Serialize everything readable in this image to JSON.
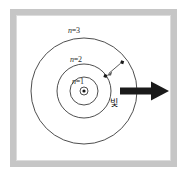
{
  "figure": {
    "frame": {
      "border_color": "#c6c6c6",
      "background_color": "#ffffff"
    },
    "colors": {
      "orbit_stroke": "#3a3a3a",
      "nucleus_stroke": "#3a3a3a",
      "nucleus_fill": "#1a1a1a",
      "electron_fill": "#1a1a1a",
      "transition_arrow": "#4a4a4a",
      "light_arrow": "#1a1a1a",
      "label_text": "#2b2b2b"
    },
    "orbits": [
      {
        "id": "n1",
        "label": "n=1",
        "label_prefix": "n",
        "label_suffix": "=1",
        "radius": 14,
        "center_x": 84,
        "center_y": 91
      },
      {
        "id": "n2",
        "label": "n=2",
        "label_prefix": "n",
        "label_suffix": "=2",
        "radius": 27,
        "center_x": 84,
        "center_y": 91
      },
      {
        "id": "n3",
        "label": "n=3",
        "label_prefix": "n",
        "label_suffix": "=3",
        "radius": 53,
        "center_x": 84,
        "center_y": 91
      }
    ],
    "nucleus": {
      "name": "nucleus",
      "outer_radius": 4,
      "inner_radius": 1.6,
      "center_x": 84,
      "center_y": 91
    },
    "electrons": [
      {
        "name": "electron-on-n3",
        "x": 122,
        "y": 62,
        "size": 3.2,
        "orbit": "n3"
      },
      {
        "name": "electron-on-n2",
        "x": 105,
        "y": 76,
        "size": 3.2,
        "orbit": "n2"
      }
    ],
    "transition_arrow": {
      "name": "electron-transition-arrow",
      "from_x": 121,
      "from_y": 63,
      "to_x": 107,
      "to_y": 75,
      "direction": "inward",
      "description": "electron falls from n=3 to n=2"
    },
    "light_arrow": {
      "name": "emitted-light-arrow",
      "label": "빛",
      "from_x": 120,
      "from_y": 91,
      "to_x": 168,
      "to_y": 91,
      "direction": "right",
      "shaft_thickness": 7
    }
  }
}
